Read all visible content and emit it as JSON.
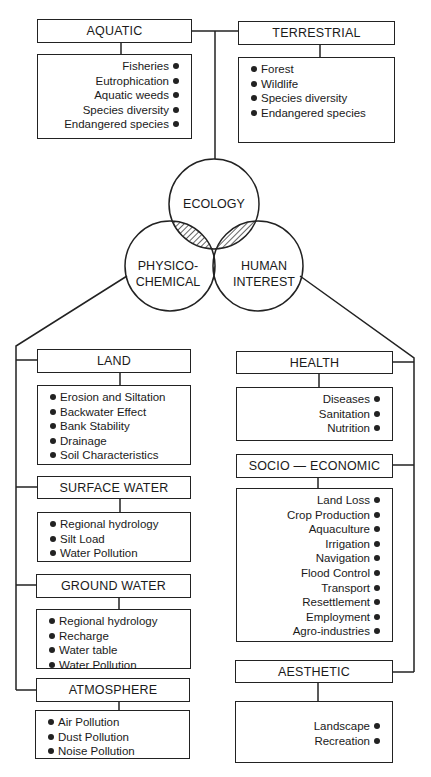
{
  "center": {
    "ecology": "ECOLOGY",
    "physico_line1": "PHYSICO-",
    "physico_line2": "CHEMICAL",
    "human_line1": "HUMAN",
    "human_line2": "INTEREST"
  },
  "top": {
    "aquatic": {
      "title": "AQUATIC",
      "items": [
        "Fisheries",
        "Eutrophication",
        "Aquatic weeds",
        "Species diversity",
        "Endangered species"
      ]
    },
    "terrestrial": {
      "title": "TERRESTRIAL",
      "items": [
        "Forest",
        "Wildlife",
        "Species diversity",
        "Endangered species"
      ]
    }
  },
  "physico": {
    "land": {
      "title": "LAND",
      "items": [
        "Erosion and Siltation",
        "Backwater Effect",
        "Bank Stability",
        "Drainage",
        "Soil Characteristics"
      ]
    },
    "surface_water": {
      "title": "SURFACE WATER",
      "items": [
        "Regional hydrology",
        "Silt Load",
        "Water Pollution"
      ]
    },
    "ground_water": {
      "title": "GROUND WATER",
      "items": [
        "Regional hydrology",
        "Recharge",
        "Water table",
        "Water Pollution"
      ]
    },
    "atmosphere": {
      "title": "ATMOSPHERE",
      "items": [
        "Air Pollution",
        "Dust Pollution",
        "Noise Pollution"
      ]
    }
  },
  "human": {
    "health": {
      "title": "HEALTH",
      "items": [
        "Diseases",
        "Sanitation",
        "Nutrition"
      ]
    },
    "socio_economic": {
      "title": "SOCIO — ECONOMIC",
      "items": [
        "Land Loss",
        "Crop Production",
        "Aquaculture",
        "Irrigation",
        "Navigation",
        "Flood Control",
        "Transport",
        "Resettlement",
        "Employment",
        "Agro-industries"
      ]
    },
    "aesthetic": {
      "title": "AESTHETIC",
      "items": [
        "Landscape",
        "Recreation"
      ]
    }
  }
}
